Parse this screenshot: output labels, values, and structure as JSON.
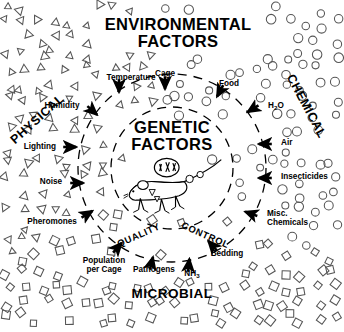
{
  "diagram": {
    "title_main": "ENVIRONMENTAL",
    "title_main2": "FACTORS",
    "center_title1": "GENETIC",
    "center_title2": "FACTORS",
    "center_icon": "mouse-with-chromosomes-icon",
    "background": "#ffffff",
    "ink": "#000000",
    "symbol_stroke": "#555555",
    "quadrants": [
      {
        "id": "physical",
        "label": "PHYSICAL",
        "symbol": "triangle",
        "rotation": -42,
        "x": 40,
        "y": 122
      },
      {
        "id": "chemical",
        "label": "CHEMICAL",
        "symbol": "circle",
        "rotation": 62,
        "x": 303,
        "y": 108
      },
      {
        "id": "microbial",
        "label": "MICROBIAL",
        "symbol": "square",
        "rotation": 0,
        "x": 172,
        "y": 298
      }
    ],
    "inner_ring_label1": "QUALITY",
    "inner_ring_label2": "CONTROL",
    "factors": [
      {
        "name": "Temperature",
        "label": "Temperature",
        "lx": 131,
        "ly": 80,
        "ax": 119,
        "ay": 88,
        "adeg": 90,
        "anchor": "middle"
      },
      {
        "name": "Cage",
        "label": "Cage",
        "lx": 165,
        "ly": 76,
        "ax": 165,
        "ay": 85,
        "adeg": 90,
        "anchor": "middle"
      },
      {
        "name": "Food",
        "label": "Food",
        "lx": 229,
        "ly": 86,
        "ax": 219,
        "ay": 93,
        "adeg": 118,
        "anchor": "middle"
      },
      {
        "name": "H2O",
        "label": "H₂O",
        "lx": 268,
        "ly": 108,
        "ax": 251,
        "ay": 110,
        "adeg": 148,
        "anchor": "start"
      },
      {
        "name": "Air",
        "label": "Air",
        "lx": 281,
        "ly": 145,
        "ax": 263,
        "ay": 144,
        "adeg": 180,
        "anchor": "start"
      },
      {
        "name": "Insecticides",
        "label": "Insecticides",
        "lx": 281,
        "ly": 179,
        "ax": 263,
        "ay": 178,
        "adeg": 180,
        "anchor": "start"
      },
      {
        "name": "Misc-Chemicals",
        "label": "Misc.",
        "lx": 267,
        "ly": 216,
        "ax": 249,
        "ay": 213,
        "adeg": 200,
        "anchor": "start"
      },
      {
        "name": "Misc-Chemicals-2",
        "label": "Chemicals",
        "lx": 267,
        "ly": 225,
        "ax": null,
        "ay": null,
        "adeg": 0,
        "anchor": "start"
      },
      {
        "name": "Bedding",
        "label": "Bedding",
        "lx": 227,
        "ly": 256,
        "ax": 211,
        "ay": 244,
        "adeg": 228,
        "anchor": "middle"
      },
      {
        "name": "NH3",
        "label": "NH₃",
        "lx": 192,
        "ly": 276,
        "ax": 189,
        "ay": 263,
        "adeg": 276,
        "anchor": "middle"
      },
      {
        "name": "Pathogens",
        "label": "Pathogens",
        "lx": 154,
        "ly": 272,
        "ax": 152,
        "ay": 261,
        "adeg": 284,
        "anchor": "middle"
      },
      {
        "name": "Population",
        "label": "Population",
        "lx": 104,
        "ly": 263,
        "ax": 119,
        "ay": 246,
        "adeg": 312,
        "anchor": "middle"
      },
      {
        "name": "Population-2",
        "label": "per Cage",
        "lx": 104,
        "ly": 272,
        "ax": null,
        "ay": null,
        "adeg": 0,
        "anchor": "middle"
      },
      {
        "name": "Pheromones",
        "label": "Pheromones",
        "lx": 52,
        "ly": 224,
        "ax": 89,
        "ay": 213,
        "adeg": 328,
        "anchor": "middle"
      },
      {
        "name": "Noise",
        "label": "Noise",
        "lx": 51,
        "ly": 184,
        "ax": 79,
        "ay": 183,
        "adeg": 0,
        "anchor": "middle"
      },
      {
        "name": "Lighting",
        "label": "Lighting",
        "lx": 40,
        "ly": 149,
        "ax": 72,
        "ay": 147,
        "adeg": 0,
        "anchor": "middle"
      },
      {
        "name": "Humidity",
        "label": "Humidity",
        "lx": 62,
        "ly": 108,
        "ax": 94,
        "ay": 112,
        "adeg": 42,
        "anchor": "middle"
      }
    ],
    "rings": [
      {
        "name": "outer-dashed-ring",
        "cx": 172,
        "cy": 168,
        "r": 94
      },
      {
        "name": "inner-dashed-ring",
        "cx": 172,
        "cy": 168,
        "r": 61
      }
    ]
  }
}
